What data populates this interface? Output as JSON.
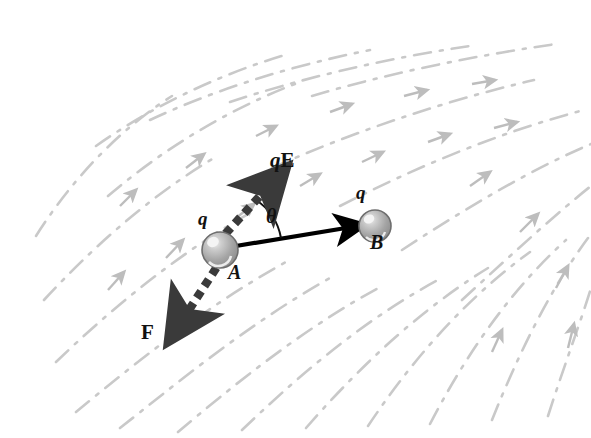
{
  "figure": {
    "background_color": "#ffffff",
    "width": 591,
    "height": 438
  },
  "colors": {
    "field_line": "#c9c9c9",
    "field_arrowhead": "#bdbdbd",
    "vector_solid": "#000000",
    "vector_dashed": "#3a3a3a",
    "sphere_fill": "#9e9e9e",
    "sphere_edge": "#6e6e6e",
    "sphere_highlight": "#f2f2f2",
    "label_text": "#111111"
  },
  "labels": {
    "charge_a": "q",
    "charge_b": "q",
    "point_a": "A",
    "point_b": "B",
    "force_electric_q": "q",
    "force_electric_E": "E",
    "applied_force": "F",
    "angle": "θ"
  },
  "elements": {
    "sphere_a": {
      "name": "A",
      "cx": 220,
      "cy": 250,
      "r": 18,
      "charge": "q"
    },
    "sphere_b": {
      "name": "B",
      "cx": 375,
      "cy": 226,
      "r": 16,
      "charge": "q"
    },
    "displacement_vector": {
      "label": "",
      "from": [
        222,
        248
      ],
      "to": [
        368,
        224
      ],
      "style": "solid",
      "color": "#000000"
    },
    "qE_vector": {
      "label": "qE",
      "from": [
        218,
        246
      ],
      "to": [
        285,
        168
      ],
      "style": "dashed-thick",
      "color": "#3a3a3a",
      "angle_deg_from_horizontal": 49
    },
    "F_vector": {
      "label": "F",
      "from": [
        222,
        254
      ],
      "to": [
        168,
        340
      ],
      "style": "dashed-thick",
      "color": "#3a3a3a",
      "angle_deg_from_horizontal": 238
    },
    "angle_arc": {
      "label": "θ",
      "vertex": [
        222,
        248
      ],
      "radius": 58,
      "between": [
        "displacement_vector",
        "qE_vector"
      ]
    }
  },
  "field": {
    "description": "non-uniform electric field lines",
    "line_style": "dash-dot",
    "color": "#c9c9c9",
    "direction": "lower-left to upper-right, fanning",
    "line_count": 13
  },
  "label_positions": {
    "qE": [
      272,
      152
    ],
    "F": [
      143,
      326
    ],
    "theta": [
      268,
      208
    ],
    "q_a": [
      200,
      218
    ],
    "A": [
      231,
      268
    ],
    "q_b": [
      358,
      190
    ],
    "B": [
      372,
      240
    ]
  }
}
